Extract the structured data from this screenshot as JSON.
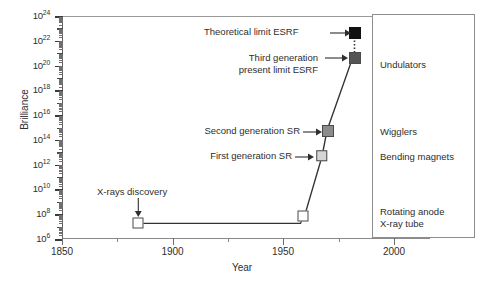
{
  "chart_data": {
    "type": "line",
    "title": "",
    "xlabel": "Year",
    "ylabel": "Brilliance",
    "xlim": [
      1850,
      2015
    ],
    "ylim_exponent": [
      6,
      24
    ],
    "y_scale": "log",
    "grid": false,
    "legend_position": "right-outside-box",
    "x_ticks": [
      1850,
      1900,
      1950,
      2000
    ],
    "x_tick_labels": [
      "1850",
      "1900",
      "1950",
      "2000"
    ],
    "x_minor_ticks": [
      1875,
      1925,
      1975
    ],
    "y_tick_exponents": [
      6,
      8,
      10,
      12,
      14,
      16,
      18,
      20,
      22,
      24
    ],
    "y_tick_labels": [
      "10^6",
      "10^8",
      "10^10",
      "10^12",
      "10^14",
      "10^16",
      "10^18",
      "10^20",
      "10^22",
      "10^24"
    ],
    "y_minor_tick_exponents": [
      7,
      9,
      11,
      13,
      15,
      17,
      19,
      21,
      23
    ],
    "series": [
      {
        "name": "Brilliance of X-ray sources",
        "points": [
          {
            "label": "X-rays discovery",
            "year": 1888,
            "exponent": 7.1,
            "marker": "square",
            "fill": "#ffffff"
          },
          {
            "label": "Rotating anode X-ray tube",
            "year": 1963,
            "exponent": 7.1,
            "marker": "square",
            "fill": "#ffffff"
          },
          {
            "label": "Rotating anode upper",
            "year": 1968,
            "exponent": 8.1,
            "marker": "square",
            "fill": "#ffffff"
          },
          {
            "label": "First generation SR",
            "year": 1976,
            "exponent": 12.5,
            "marker": "square",
            "fill": "#d6d6d6"
          },
          {
            "label": "Second generation SR",
            "year": 1980,
            "exponent": 14.6,
            "marker": "square",
            "fill": "#8c8c8c"
          },
          {
            "label": "Third generation present limit ESRF",
            "year": 1994,
            "exponent": 20.9,
            "marker": "square",
            "fill": "#555555"
          },
          {
            "label": "Theoretical limit ESRF",
            "year": 1994,
            "exponent": 22.9,
            "marker": "square",
            "fill": "#111111"
          }
        ],
        "dashed_segment": "third-generation to theoretical-limit"
      }
    ],
    "annotations": [
      {
        "text": "X-rays discovery",
        "target_year": 1888,
        "target_exponent": 7.1,
        "arrow": "down"
      },
      {
        "text": "First generation SR",
        "target_year": 1976,
        "target_exponent": 12.5,
        "arrow": "right"
      },
      {
        "text": "Second generation SR",
        "target_year": 1980,
        "target_exponent": 14.6,
        "arrow": "right"
      },
      {
        "text": "Third generation present limit ESRF",
        "target_year": 1994,
        "target_exponent": 20.9,
        "arrow": "right"
      },
      {
        "text": "Theoretical limit ESRF",
        "target_year": 1994,
        "target_exponent": 22.9,
        "arrow": "right"
      }
    ],
    "legend_entries": [
      {
        "label": "Undulators",
        "exponent_center": 20.6
      },
      {
        "label": "Wigglers",
        "exponent_center": 14.6
      },
      {
        "label": "Bending magnets",
        "exponent_center": 12.5
      },
      {
        "label": "Rotating anode",
        "exponent_center": 8.0
      },
      {
        "label": "X-ray tube",
        "exponent_center": 7.2
      }
    ]
  },
  "axes": {
    "y_title": "Brilliance",
    "x_title": "Year",
    "y_labels": [
      {
        "base": "10",
        "exp": "24"
      },
      {
        "base": "10",
        "exp": "22"
      },
      {
        "base": "10",
        "exp": "20"
      },
      {
        "base": "10",
        "exp": "18"
      },
      {
        "base": "10",
        "exp": "16"
      },
      {
        "base": "10",
        "exp": "14"
      },
      {
        "base": "10",
        "exp": "12"
      },
      {
        "base": "10",
        "exp": "10"
      },
      {
        "base": "10",
        "exp": "8"
      },
      {
        "base": "10",
        "exp": "6"
      }
    ],
    "x_labels": [
      "1850",
      "1900",
      "1950",
      "2000"
    ]
  },
  "annotations": {
    "theoretical_limit": "Theoretical limit ESRF",
    "third_generation_line1": "Third generation",
    "third_generation_line2": "present limit ESRF",
    "second_generation": "Second generation SR",
    "first_generation": "First generation SR",
    "xray_discovery": "X-rays discovery"
  },
  "legend": {
    "undulators": "Undulators",
    "wigglers": "Wigglers",
    "bending_magnets": "Bending magnets",
    "rotating_anode_line1": "Rotating anode",
    "rotating_anode_line2": "X-ray tube"
  },
  "colors": {
    "axis": "#8a8a8a",
    "line": "#333333",
    "marker_white": "#ffffff",
    "marker_light": "#d6d6d6",
    "marker_mid": "#8c8c8c",
    "marker_dark": "#555555",
    "marker_black": "#111111"
  }
}
